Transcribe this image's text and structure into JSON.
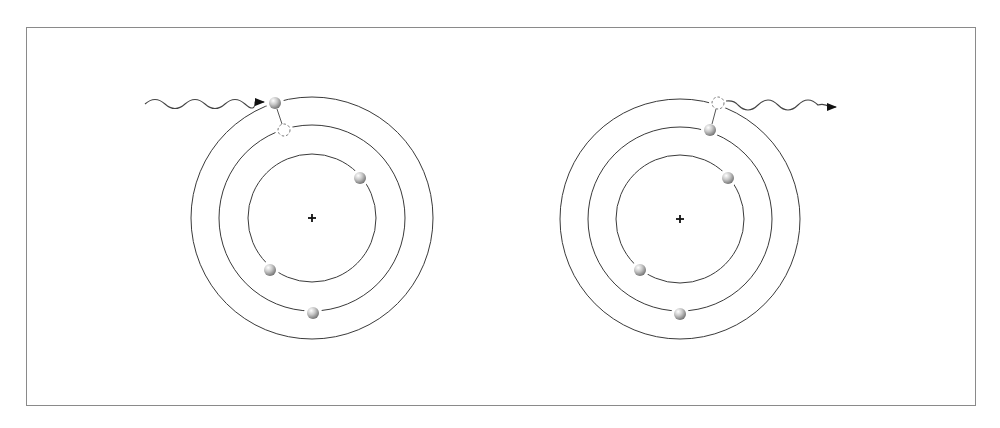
{
  "diagram": {
    "type": "bohr-atom-emission-absorption",
    "colors": {
      "frame": "#8a8a8a",
      "orbit": "#3a3a3a",
      "electron_light": "#f4f4f4",
      "electron_dark": "#7c7c7c",
      "photon": "#444444",
      "nucleus": "#111111"
    },
    "atoms": [
      {
        "name": "absorption",
        "center": [
          312,
          218
        ],
        "orbit_radii": [
          64,
          93,
          121
        ],
        "nucleus_symbol": "+",
        "electrons": [
          {
            "x": 275,
            "y": 103,
            "orbit": 3,
            "label": "excited electron"
          },
          {
            "x": 360,
            "y": 178,
            "orbit": 1
          },
          {
            "x": 270,
            "y": 270,
            "orbit": 1
          },
          {
            "x": 313,
            "y": 313,
            "orbit": 2
          }
        ],
        "vacancy": {
          "x": 284,
          "y": 130,
          "orbit": 2
        },
        "photon": {
          "direction": "incoming",
          "from": [
            145,
            104
          ],
          "to": [
            265,
            104
          ]
        }
      },
      {
        "name": "emission",
        "center": [
          680,
          219
        ],
        "orbit_radii": [
          64,
          92,
          120
        ],
        "nucleus_symbol": "+",
        "electrons": [
          {
            "x": 710,
            "y": 130,
            "orbit": 2,
            "label": "relaxed electron"
          },
          {
            "x": 728,
            "y": 178,
            "orbit": 1
          },
          {
            "x": 640,
            "y": 270,
            "orbit": 1
          },
          {
            "x": 680,
            "y": 314,
            "orbit": 2
          }
        ],
        "vacancy": {
          "x": 718,
          "y": 103,
          "orbit": 3
        },
        "photon": {
          "direction": "outgoing",
          "from": [
            727,
            102
          ],
          "to": [
            838,
            107
          ]
        }
      }
    ]
  }
}
